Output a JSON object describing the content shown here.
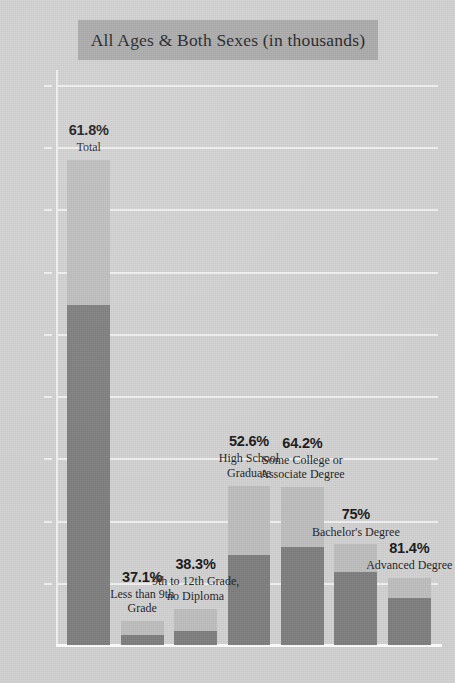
{
  "chart_data": {
    "type": "bar",
    "title": "All Ages & Both Sexes (in thousands)",
    "xlabel": "",
    "ylabel": "",
    "ylim": [
      0,
      231
    ],
    "y_unit": "thousands",
    "grid": true,
    "legend": "none",
    "ytick_labels": [
      "225K",
      "200K",
      "175K",
      "150K",
      "125K",
      "100K",
      "75K",
      "50K",
      "25K"
    ],
    "ytick_values": [
      225,
      200,
      175,
      150,
      125,
      100,
      75,
      50,
      25
    ],
    "categories": [
      "Total",
      "Less than 9th Grade",
      "9th to 12th Grade, no Diploma",
      "High School Graduate",
      "Some College or Associate Degree",
      "Bachelor's Degree",
      "Advanced Degree"
    ],
    "data_labels": [
      "61.8%",
      "37.1%",
      "38.3%",
      "52.6%",
      "64.2%",
      "75%",
      "81.4%"
    ],
    "series": [
      {
        "name": "Lower segment (dark)",
        "color": "#7e7e7e",
        "values": [
          136.5,
          4.0,
          5.6,
          36.0,
          39.5,
          29.5,
          19.0
        ]
      },
      {
        "name": "Upper segment (light)",
        "color": "#bebebe",
        "values": [
          58.5,
          5.6,
          9.0,
          28.0,
          24.0,
          11.0,
          8.0
        ]
      }
    ],
    "totals": [
      195.0,
      9.6,
      14.6,
      64.0,
      63.5,
      40.5,
      27.0
    ],
    "colors": {
      "background": "#d2d2d2",
      "title_band": "#aaaaaa",
      "gridline": "#f2f2f2",
      "bar_light": "#bebebe",
      "bar_dark": "#7e7e7e",
      "text": "#161616"
    }
  }
}
